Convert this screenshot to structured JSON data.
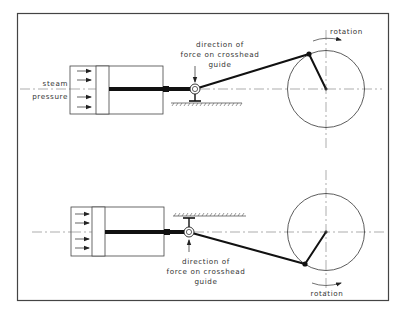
{
  "figure": {
    "frame_color": "#444444",
    "line_color": "#111111",
    "top_diagram": {
      "steam_label_line1": "steam",
      "steam_label_line2": "pressure",
      "force_label_line1": "direction of",
      "force_label_line2": "force on crosshead",
      "force_label_line3": "guide",
      "rotation_label": "rotation",
      "guide_position": "below",
      "crank_position": "upper-left"
    },
    "bottom_diagram": {
      "force_label_line1": "direction of",
      "force_label_line2": "force on crosshead",
      "force_label_line3": "guide",
      "rotation_label": "rotation",
      "guide_position": "above",
      "crank_position": "lower-left"
    }
  }
}
